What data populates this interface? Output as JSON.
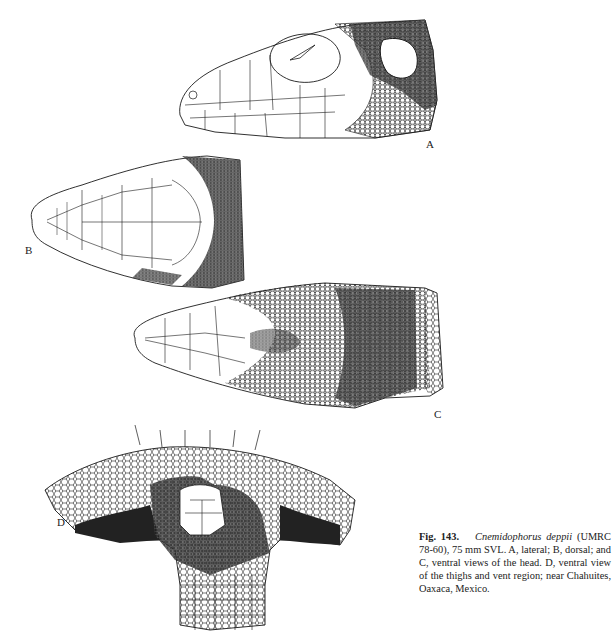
{
  "figure": {
    "number": "Fig. 143.",
    "species": "Cnemidophorus deppii",
    "caption_rest": "(UMRC 78-60), 75 mm SVL. A, lateral; B, dorsal; and C, ventral views of the head. D, ventral view of the thighs and vent region; near Chahuites, Oaxaca, Mexico.",
    "panels": [
      {
        "id": "A",
        "label": "A",
        "description": "lateral view of the head"
      },
      {
        "id": "B",
        "label": "B",
        "description": "dorsal view of the head"
      },
      {
        "id": "C",
        "label": "C",
        "description": "ventral view of the head"
      },
      {
        "id": "D",
        "label": "D",
        "description": "ventral view of the thighs and vent region"
      }
    ]
  },
  "colors": {
    "ink": "#1a1a1a",
    "paper": "#ffffff"
  }
}
